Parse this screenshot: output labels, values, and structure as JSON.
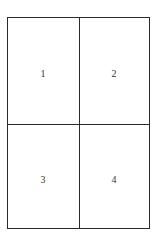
{
  "diagram": {
    "type": "2x2 page grid",
    "cells": [
      {
        "label": "1"
      },
      {
        "label": "2"
      },
      {
        "label": "3"
      },
      {
        "label": "4"
      }
    ],
    "colors": {
      "line": "#2a2a2a",
      "text": "#333333",
      "background": "#ffffff"
    }
  }
}
